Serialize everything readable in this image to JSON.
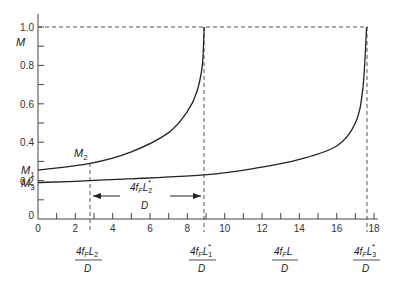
{
  "chart_data": {
    "type": "line",
    "title": "",
    "xlabel": "4f̄F L / D",
    "ylabel": "M",
    "xlim": [
      0,
      18
    ],
    "ylim": [
      0,
      1.0
    ],
    "x_ticks": [
      "0",
      "2",
      "4",
      "6",
      "8",
      "10",
      "12",
      "14",
      "16",
      "18"
    ],
    "y_ticks": [
      "0",
      "0.2",
      "0.4",
      "0.6",
      "0.8",
      "1.0"
    ],
    "grid": false,
    "series": [
      {
        "name": "M1 curve",
        "x": [
          0,
          2.8,
          5,
          7,
          8,
          8.5,
          8.8,
          8.9
        ],
        "values": [
          0.255,
          0.29,
          0.35,
          0.45,
          0.56,
          0.66,
          0.8,
          1.0
        ]
      },
      {
        "name": "M3 curve",
        "x": [
          0,
          2.8,
          8.9,
          12,
          14,
          16,
          17,
          17.4,
          17.6
        ],
        "values": [
          0.19,
          0.2,
          0.23,
          0.27,
          0.31,
          0.38,
          0.5,
          0.68,
          1.0
        ]
      }
    ],
    "annotations": [
      {
        "text": "M1",
        "at_y": 0.255
      },
      {
        "text": "M3",
        "at_y": 0.19
      },
      {
        "text": "M2",
        "at_x": 2.8,
        "at_y": 0.29
      },
      {
        "text": "4f̄F L2* / D",
        "type": "double-arrow",
        "from_x": 2.8,
        "to_x": 8.9
      },
      {
        "text": "4f̄F L2 / D",
        "x": 2.8
      },
      {
        "text": "4f̄F L1* / D",
        "x": 8.9
      },
      {
        "text": "4f̄F L / D",
        "x": 13.2
      },
      {
        "text": "4f̄F L3* / D",
        "x": 17.6
      }
    ],
    "reference_lines": [
      {
        "type": "horizontal",
        "y": 1.0,
        "style": "dashed"
      },
      {
        "type": "vertical",
        "x": 2.8,
        "style": "dashed"
      },
      {
        "type": "vertical",
        "x": 8.9,
        "style": "dashed"
      },
      {
        "type": "vertical",
        "x": 17.6,
        "style": "dashed"
      }
    ]
  },
  "labels": {
    "y_axis": "M",
    "m1": "M",
    "m1_sub": "1",
    "m2": "M",
    "m2_sub": "2",
    "m3": "M",
    "m3_sub": "3",
    "four": "4",
    "f": "f",
    "F": "F",
    "L": "L",
    "D": "D",
    "star": "*",
    "sub1": "1",
    "sub2": "2",
    "sub3": "3"
  }
}
